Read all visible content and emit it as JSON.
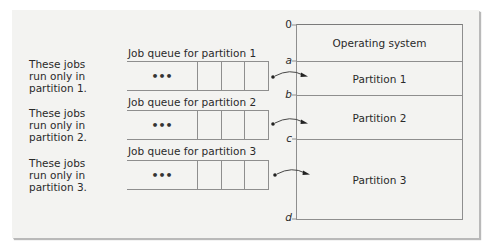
{
  "diagram": {
    "notes": [
      {
        "lines": [
          "These jobs",
          "run only in",
          "partition 1."
        ]
      },
      {
        "lines": [
          "These jobs",
          "run only in",
          "partition 2."
        ]
      },
      {
        "lines": [
          "These jobs",
          "run only in",
          "partition 3."
        ]
      }
    ],
    "queues": [
      {
        "label": "Job queue for partition 1",
        "ellipsis": "•••",
        "target": "Partition 1"
      },
      {
        "label": "Job queue for partition 2",
        "ellipsis": "•••",
        "target": "Partition 2"
      },
      {
        "label": "Job queue for partition 3",
        "ellipsis": "•••",
        "target": "Partition 3"
      }
    ],
    "memory": {
      "regions": [
        {
          "label": "Operating system",
          "start": "0",
          "end": "a"
        },
        {
          "label": "Partition 1",
          "start": "a",
          "end": "b"
        },
        {
          "label": "Partition 2",
          "start": "b",
          "end": "c"
        },
        {
          "label": "Partition 3",
          "start": "c",
          "end": "d"
        }
      ],
      "addresses": [
        "0",
        "a",
        "b",
        "c",
        "d"
      ]
    },
    "colors": {
      "panel_background": "#f3f3f1",
      "line": "#8e8e8e",
      "text": "#2a2a2a"
    }
  }
}
